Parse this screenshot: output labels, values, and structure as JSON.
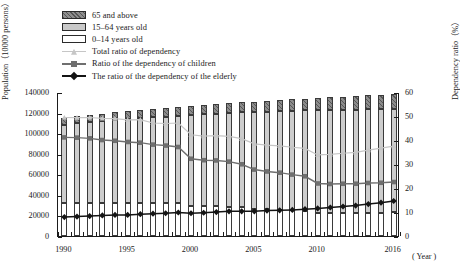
{
  "legend": {
    "items": [
      {
        "key": "elder-pop",
        "label": "65 and above",
        "kind": "swatch",
        "color": "#8c8c8c"
      },
      {
        "key": "work-pop",
        "label": "15–64 years old",
        "kind": "swatch",
        "color": "#cdcdcd"
      },
      {
        "key": "child-pop",
        "label": "0–14 years old",
        "kind": "swatch",
        "color": "#ffffff"
      },
      {
        "key": "total-dep",
        "label": "Total ratio of dependency",
        "kind": "line",
        "color": "#c6c6c6"
      },
      {
        "key": "child-dep",
        "label": "Ratio of the dependency of children",
        "kind": "line",
        "color": "#6f6f6f"
      },
      {
        "key": "elder-dep",
        "label": "The ratio of the dependency  of the elderly",
        "kind": "line",
        "color": "#141414"
      }
    ]
  },
  "axes": {
    "y_left_title": "Population（10000 persons）",
    "y_right_title": "Dependency ratio（%）",
    "x_title": "( Year )",
    "y_left_ticks": [
      "140000",
      "120000",
      "100000",
      "80000",
      "60000",
      "40000",
      "20000",
      "0"
    ],
    "y_right_ticks": [
      "60",
      "50",
      "40",
      "30",
      "20",
      "10",
      "0"
    ],
    "x_ticks": [
      "1990",
      "1995",
      "2000",
      "2005",
      "2010",
      "2016"
    ]
  },
  "chart_data": {
    "type": "bar",
    "title": "",
    "xlabel": "( Year )",
    "ylabel": "Population（10000 persons）",
    "y2label": "Dependency ratio（%）",
    "ylim": [
      0,
      140000
    ],
    "y2lim": [
      0,
      60
    ],
    "grid": false,
    "legend_position": "top-left",
    "categories": [
      1990,
      1991,
      1992,
      1993,
      1994,
      1995,
      1996,
      1997,
      1998,
      1999,
      2000,
      2001,
      2002,
      2003,
      2004,
      2005,
      2006,
      2007,
      2008,
      2009,
      2010,
      2011,
      2012,
      2013,
      2014,
      2015,
      2016
    ],
    "series": [
      {
        "name": "0–14 years old",
        "type": "bar-stack",
        "values": [
          31659,
          32095,
          32341,
          32177,
          32360,
          32218,
          32311,
          32093,
          32064,
          31950,
          29012,
          28716,
          28774,
          28559,
          27947,
          26504,
          25961,
          25660,
          25166,
          24659,
          22259,
          22164,
          22287,
          22329,
          22558,
          22715,
          23008
        ]
      },
      {
        "name": "15–64 years old",
        "type": "bar-stack",
        "values": [
          76306,
          77614,
          78693,
          79577,
          80655,
          81393,
          82245,
          83448,
          84059,
          85157,
          88910,
          89849,
          90302,
          90976,
          92184,
          94197,
          95068,
          95833,
          96680,
          97484,
          99938,
          100283,
          100403,
          100582,
          100469,
          100361,
          100260
        ]
      },
      {
        "name": "65 and above",
        "type": "bar-stack",
        "values": [
          6368,
          6604,
          6867,
          7157,
          7412,
          7510,
          7840,
          8085,
          8359,
          8679,
          8821,
          9062,
          9377,
          9692,
          9857,
          10055,
          10419,
          10636,
          10956,
          11307,
          11894,
          12288,
          12714,
          13161,
          13755,
          14386,
          15003
        ]
      },
      {
        "name": "Total ratio of dependency",
        "type": "line",
        "axis": "right",
        "values": [
          49.8,
          49.7,
          49.8,
          49.4,
          49.3,
          48.8,
          48.9,
          47.5,
          47.3,
          47.5,
          42.6,
          42.0,
          42.2,
          41.9,
          41.0,
          38.8,
          38.3,
          38.0,
          37.4,
          36.9,
          34.2,
          34.4,
          34.9,
          35.3,
          36.2,
          37.0,
          37.9
        ]
      },
      {
        "name": "Ratio of the dependency of children",
        "type": "line",
        "axis": "right",
        "values": [
          41.5,
          41.4,
          41.1,
          40.4,
          40.1,
          39.6,
          39.3,
          38.5,
          38.1,
          37.5,
          32.6,
          32.0,
          31.9,
          31.4,
          30.3,
          28.1,
          27.3,
          26.8,
          26.0,
          25.3,
          22.3,
          22.1,
          22.2,
          22.2,
          22.5,
          22.6,
          22.9
        ]
      },
      {
        "name": "The ratio of the dependency  of the elderly",
        "type": "line",
        "axis": "right",
        "values": [
          8.3,
          8.5,
          8.7,
          9.0,
          9.2,
          9.2,
          9.5,
          9.7,
          9.9,
          10.2,
          9.9,
          10.1,
          10.4,
          10.7,
          10.7,
          10.7,
          11.0,
          11.1,
          11.3,
          11.6,
          11.9,
          12.3,
          12.7,
          13.1,
          13.7,
          14.3,
          15.0
        ]
      }
    ]
  }
}
